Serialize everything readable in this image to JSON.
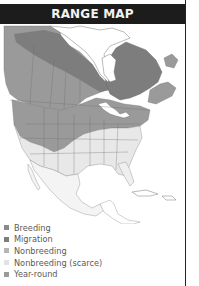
{
  "title": "RANGE MAP",
  "colors": {
    "title_bar": "#1c1c1c",
    "breeding": "#8a8a8a",
    "migration": "#7d7d7d",
    "nonbreeding": "#b5b5b5",
    "nonbreeding_scarce": "#e2e2e2",
    "year_round": "#9a9a9a",
    "land": "#ffffff",
    "borders": "#888888"
  },
  "legend": {
    "items": [
      {
        "label": "Breeding",
        "color": "#8a8a8a"
      },
      {
        "label": "Migration",
        "color": "#7d7d7d"
      },
      {
        "label": "Nonbreeding",
        "color": "#b5b5b5"
      },
      {
        "label": "Nonbreeding (scarce)",
        "color": "#e2e2e2"
      },
      {
        "label": "Year-round",
        "color": "#9a9a9a"
      }
    ]
  }
}
